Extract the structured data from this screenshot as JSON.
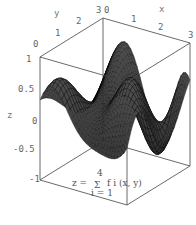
{
  "chart_data": {
    "type": "surface3d",
    "title": "",
    "annotation": "z = Σ_{i=1}^{4} f_i(x, y)",
    "annotation_parts": {
      "lhs": "z =",
      "sum": "Σ",
      "upper": "4",
      "lower": "i = 1",
      "rhs": "f i (x, y)"
    },
    "xlabel": "x",
    "ylabel": "y",
    "zlabel": "z",
    "x_ticks": [
      "0",
      "1",
      "2",
      "3"
    ],
    "y_ticks": [
      "0",
      "1",
      "2",
      "3"
    ],
    "z_ticks": [
      "-1",
      "-0.5",
      "0",
      "0.5",
      "1"
    ],
    "xlim": [
      0,
      3
    ],
    "ylim": [
      0,
      3
    ],
    "zlim": [
      -1,
      1
    ],
    "boxed": true,
    "mesh": true,
    "colors": {
      "surface": "#2a2a2a",
      "mesh": "#000000",
      "box": "#444444",
      "text": "#666666"
    }
  }
}
